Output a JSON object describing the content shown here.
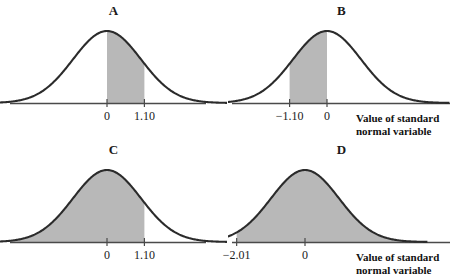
{
  "figure": {
    "background_color": "#ffffff",
    "curve_color": "#2b2b2b",
    "fill_color": "#b8b8b8",
    "axis_color": "#4a4a4a"
  },
  "captions": {
    "b_line1": "Value of standard",
    "b_line2": "normal variable",
    "d_line1": "Value of standard",
    "d_line2": "normal variable"
  },
  "chart_data": [
    {
      "type": "area",
      "title": "A",
      "xlabel": "",
      "ylabel": "",
      "distribution": "standard normal",
      "mean": 0,
      "sd": 1,
      "xlim": [
        -3.6,
        3.6
      ],
      "grid": false,
      "legend": "none",
      "shade_from": 0,
      "shade_to": 1.1,
      "shade_kind": "interval",
      "tick_values": [
        0,
        1.1
      ],
      "tick_labels": [
        "0",
        "1.10"
      ],
      "tick_px": [
        107,
        144
      ]
    },
    {
      "type": "area",
      "title": "B",
      "xlabel": "Value of standard normal variable",
      "ylabel": "",
      "distribution": "standard normal",
      "mean": 0,
      "sd": 1,
      "xlim": [
        -3.6,
        3.6
      ],
      "grid": false,
      "legend": "none",
      "shade_from": -1.1,
      "shade_to": 0,
      "shade_kind": "interval",
      "tick_values": [
        -1.1,
        0
      ],
      "tick_labels": [
        "−1.10",
        "0"
      ],
      "tick_px": [
        62,
        99
      ]
    },
    {
      "type": "area",
      "title": "C",
      "xlabel": "",
      "ylabel": "",
      "distribution": "standard normal",
      "mean": 0,
      "sd": 1,
      "xlim": [
        -3.6,
        3.6
      ],
      "grid": false,
      "legend": "none",
      "shade_from": -3.6,
      "shade_to": 1.1,
      "shade_kind": "lower-tail",
      "tick_values": [
        0,
        1.1
      ],
      "tick_labels": [
        "0",
        "1.10"
      ],
      "tick_px": [
        107,
        144
      ]
    },
    {
      "type": "area",
      "title": "D",
      "xlabel": "Value of standard normal variable",
      "ylabel": "",
      "distribution": "standard normal",
      "mean": 0,
      "sd": 1,
      "xlim": [
        -3.6,
        3.6
      ],
      "grid": false,
      "legend": "none",
      "shade_from": -2.01,
      "shade_to": 3.6,
      "shade_kind": "upper-tail",
      "tick_values": [
        -2.01,
        0
      ],
      "tick_labels": [
        "−2.01",
        "0"
      ],
      "tick_px": [
        31,
        77
      ]
    }
  ]
}
